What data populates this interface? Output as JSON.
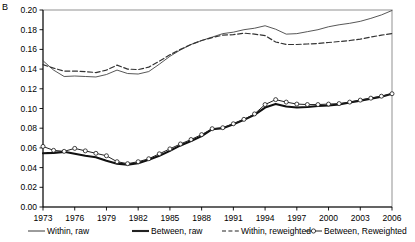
{
  "panel": {
    "label": "B"
  },
  "chart_data": {
    "type": "line",
    "title": "",
    "subtitle": "",
    "xlabel": "",
    "ylabel": "",
    "xlim": [
      1973,
      2006
    ],
    "ylim": [
      0.0,
      0.2
    ],
    "grid": false,
    "legend_position": "bottom",
    "x": [
      1973,
      1974,
      1975,
      1976,
      1977,
      1978,
      1979,
      1980,
      1981,
      1982,
      1983,
      1984,
      1985,
      1986,
      1987,
      1988,
      1989,
      1990,
      1991,
      1992,
      1993,
      1994,
      1995,
      1996,
      1997,
      1998,
      1999,
      2000,
      2001,
      2002,
      2003,
      2004,
      2005,
      2006
    ],
    "xticks": [
      1973,
      1976,
      1979,
      1982,
      1985,
      1988,
      1991,
      1994,
      1997,
      2000,
      2003,
      2006
    ],
    "yticks": [
      0.0,
      0.02,
      0.04,
      0.06,
      0.08,
      0.1,
      0.12,
      0.14,
      0.16,
      0.18,
      0.2
    ],
    "ytick_labels": [
      "0.00",
      "0.02",
      "0.04",
      "0.06",
      "0.08",
      "0.10",
      "0.12",
      "0.14",
      "0.16",
      "0.18",
      "0.20"
    ],
    "xtick_labels": [
      "1973",
      "1976",
      "1979",
      "1982",
      "1985",
      "1988",
      "1991",
      "1994",
      "1997",
      "2000",
      "2003",
      "2006"
    ],
    "series": [
      {
        "name": "Within, raw",
        "style": "thin-solid",
        "color": "#444444",
        "values": [
          0.1485,
          0.139,
          0.1325,
          0.133,
          0.1325,
          0.132,
          0.1345,
          0.139,
          0.1355,
          0.135,
          0.1375,
          0.145,
          0.153,
          0.1595,
          0.165,
          0.169,
          0.1725,
          0.176,
          0.1775,
          0.18,
          0.1815,
          0.184,
          0.1805,
          0.1755,
          0.176,
          0.178,
          0.18,
          0.183,
          0.185,
          0.1865,
          0.1885,
          0.1915,
          0.195,
          0.1995
        ]
      },
      {
        "name": "Between, raw",
        "style": "thick-solid",
        "color": "#111111",
        "values": [
          0.0545,
          0.055,
          0.056,
          0.054,
          0.052,
          0.0505,
          0.047,
          0.044,
          0.043,
          0.0445,
          0.048,
          0.052,
          0.057,
          0.0625,
          0.067,
          0.072,
          0.079,
          0.08,
          0.084,
          0.0885,
          0.0935,
          0.101,
          0.1045,
          0.102,
          0.101,
          0.1015,
          0.1025,
          0.103,
          0.104,
          0.106,
          0.108,
          0.11,
          0.112,
          0.115
        ]
      },
      {
        "name": "Within, reweighted",
        "style": "dashed",
        "color": "#333333",
        "values": [
          0.1445,
          0.141,
          0.138,
          0.138,
          0.1375,
          0.1365,
          0.139,
          0.144,
          0.14,
          0.1395,
          0.142,
          0.148,
          0.1545,
          0.16,
          0.165,
          0.169,
          0.172,
          0.1745,
          0.175,
          0.1765,
          0.1755,
          0.174,
          0.1675,
          0.165,
          0.165,
          0.1655,
          0.166,
          0.167,
          0.168,
          0.169,
          0.1705,
          0.1725,
          0.1745,
          0.176
        ]
      },
      {
        "name": "Between, Reweighted",
        "style": "marker-solid",
        "color": "#222222",
        "values": [
          0.0615,
          0.0575,
          0.0565,
          0.0595,
          0.057,
          0.0545,
          0.052,
          0.046,
          0.044,
          0.046,
          0.049,
          0.054,
          0.059,
          0.064,
          0.0685,
          0.0735,
          0.0795,
          0.0805,
          0.0845,
          0.089,
          0.0945,
          0.104,
          0.109,
          0.1065,
          0.1045,
          0.104,
          0.104,
          0.1045,
          0.105,
          0.1065,
          0.1085,
          0.1105,
          0.1125,
          0.115
        ]
      }
    ]
  },
  "legend": {
    "items": [
      {
        "label": "Within, raw",
        "style": "thin-solid"
      },
      {
        "label": "Between, raw",
        "style": "thick-solid"
      },
      {
        "label": "Within, reweighted",
        "style": "dashed"
      },
      {
        "label": "Between, Reweighted",
        "style": "marker-solid"
      }
    ]
  }
}
